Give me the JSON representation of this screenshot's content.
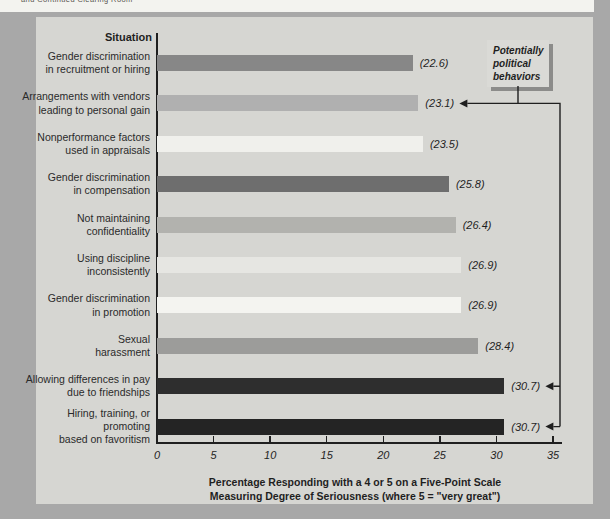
{
  "page": {
    "clipped_top_text": "and Continued Clearing Room",
    "colors": {
      "page_background": "#a8a8a8",
      "panel_background": "#d6d6d2",
      "top_strip_background": "#f3f3ef",
      "axis_and_text": "#1f1f1f",
      "callout_background": "#dadad6",
      "callout_shadow": "#8c8c8a"
    }
  },
  "callout": {
    "lines": [
      "Potentially",
      "political",
      "behaviors"
    ]
  },
  "chart_data": {
    "type": "bar",
    "orientation": "horizontal",
    "title": "",
    "ylabel": "Situation",
    "xlabel_line1": "Percentage Responding with a 4 or 5 on a Five-Point Scale",
    "xlabel_line2": "Measuring Degree of Seriousness (where 5 = \"very great\")",
    "xlim": [
      0,
      35
    ],
    "xticks": [
      0,
      5,
      10,
      15,
      20,
      25,
      30,
      35
    ],
    "grid": false,
    "legend": false,
    "categories": [
      [
        "Gender discrimination",
        "in recruitment or hiring"
      ],
      [
        "Arrangements with vendors",
        "leading to personal gain"
      ],
      [
        "Nonperformance factors",
        "used in appraisals"
      ],
      [
        "Gender discrimination",
        "in compensation"
      ],
      [
        "Not maintaining",
        "confidentiality"
      ],
      [
        "Using discipline",
        "inconsistently"
      ],
      [
        "Gender discrimination",
        "in promotion"
      ],
      [
        "Sexual",
        "harassment"
      ],
      [
        "Allowing differences in pay",
        "due to friendships"
      ],
      [
        "Hiring, training, or promoting",
        "based on favoritism"
      ]
    ],
    "values": [
      22.6,
      23.1,
      23.5,
      25.8,
      26.4,
      26.9,
      26.9,
      28.4,
      30.7,
      30.7
    ],
    "value_labels": [
      "(22.6)",
      "(23.1)",
      "(23.5)",
      "(25.8)",
      "(26.4)",
      "(26.9)",
      "(26.9)",
      "(28.4)",
      "(30.7)",
      "(30.7)"
    ],
    "bar_colors": [
      "#878787",
      "#b0b0b0",
      "#f0f0ec",
      "#6e6e6e",
      "#b2b2ae",
      "#e6e6e2",
      "#f4f4f0",
      "#9c9c9a",
      "#2e2e2e",
      "#242424"
    ],
    "annotated_indices": [
      1,
      8,
      9
    ],
    "annotation_label": "Potentially political behaviors"
  }
}
